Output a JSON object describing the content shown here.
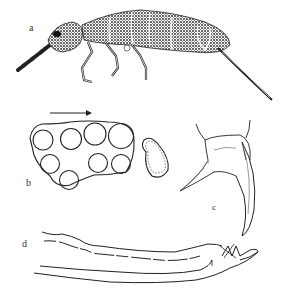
{
  "figure": {
    "panels": [
      {
        "id": "a",
        "label": "a",
        "subject": "collembolan habitus, lateral view"
      },
      {
        "id": "b",
        "label": "b",
        "subject": "ocelli cluster and postantennal organ"
      },
      {
        "id": "c",
        "label": "c",
        "subject": "claw"
      },
      {
        "id": "d",
        "label": "d",
        "subject": "mucro and dens"
      }
    ],
    "arrow": "direction-arrow-right"
  },
  "colors": {
    "ink": "#1a1a1a",
    "background": "#ffffff"
  }
}
